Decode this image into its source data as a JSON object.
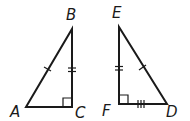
{
  "diagram": {
    "triangles": [
      {
        "name": "ABC",
        "vertices": {
          "A": {
            "label": "A",
            "x": 26,
            "y": 107
          },
          "B": {
            "label": "B",
            "x": 72,
            "y": 29
          },
          "C": {
            "label": "C",
            "x": 72,
            "y": 107
          }
        },
        "right_angle_at": "C",
        "marks": [
          {
            "side": "AB",
            "ticks": 1
          },
          {
            "side": "BC",
            "ticks": 2
          }
        ]
      },
      {
        "name": "EFD",
        "vertices": {
          "E": {
            "label": "E",
            "x": 119,
            "y": 27
          },
          "F": {
            "label": "F",
            "x": 119,
            "y": 104
          },
          "D": {
            "label": "D",
            "x": 167,
            "y": 104
          }
        },
        "right_angle_at": "F",
        "marks": [
          {
            "side": "ED",
            "ticks": 1
          },
          {
            "side": "EF",
            "ticks": 2
          },
          {
            "side": "FD",
            "ticks": 3
          }
        ]
      }
    ],
    "labels": {
      "A": "A",
      "B": "B",
      "C": "C",
      "D": "D",
      "E": "E",
      "F": "F"
    },
    "colors": {
      "stroke": "#1a1a1a",
      "background": "#ffffff"
    }
  }
}
